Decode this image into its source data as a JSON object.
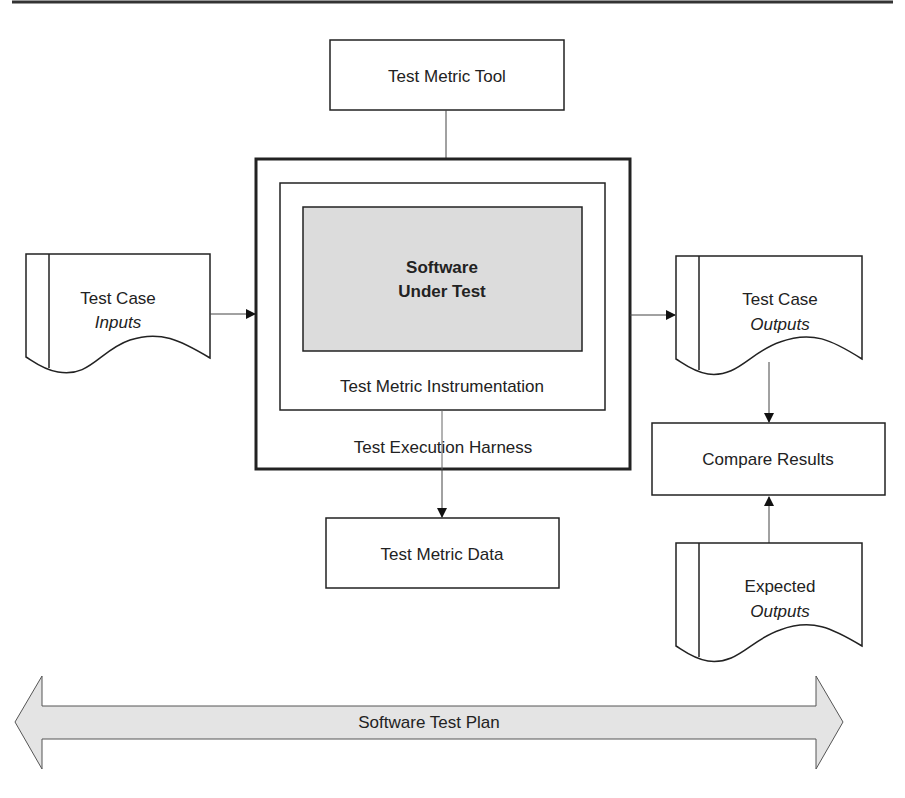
{
  "diagram": {
    "header_rule": true,
    "nodes": {
      "test_metric_tool": {
        "label": "Test Metric Tool"
      },
      "software_under_test": {
        "line1": "Software",
        "line2": "Under Test",
        "fill": "#dcdcdc"
      },
      "instrumentation": {
        "label": "Test Metric Instrumentation"
      },
      "harness": {
        "label": "Test Execution Harness"
      },
      "test_metric_data": {
        "label": "Test Metric Data"
      },
      "test_case_inputs": {
        "line1": "Test Case",
        "line2": "Inputs"
      },
      "test_case_outputs": {
        "line1": "Test Case",
        "line2": "Outputs"
      },
      "compare_results": {
        "label": "Compare Results"
      },
      "expected_outputs": {
        "line1": "Expected",
        "line2": "Outputs"
      },
      "test_plan": {
        "label": "Software Test Plan",
        "fill": "#e4e4e4"
      }
    },
    "edges": [
      {
        "from": "Test Metric Tool",
        "to": "Test Execution Harness"
      },
      {
        "from": "Test Case Inputs",
        "to": "Test Execution Harness"
      },
      {
        "from": "Test Execution Harness",
        "to": "Test Case Outputs"
      },
      {
        "from": "Test Execution Harness",
        "to": "Test Metric Data"
      },
      {
        "from": "Test Case Outputs",
        "to": "Compare Results"
      },
      {
        "from": "Expected Outputs",
        "to": "Compare Results"
      }
    ]
  }
}
